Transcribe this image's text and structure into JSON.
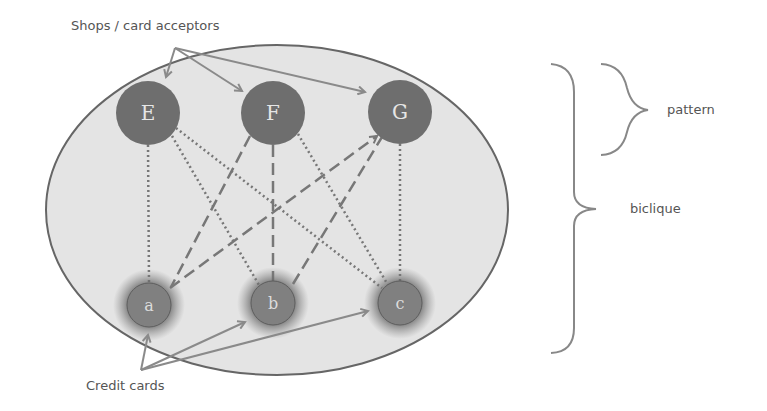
{
  "diagram": {
    "labels": {
      "shops": "Shops / card acceptors",
      "cards": "Credit cards",
      "pattern": "pattern",
      "biclique": "biclique"
    },
    "shop_nodes": [
      {
        "id": "E",
        "label": "E"
      },
      {
        "id": "F",
        "label": "F"
      },
      {
        "id": "G",
        "label": "G"
      }
    ],
    "card_nodes": [
      {
        "id": "a",
        "label": "a"
      },
      {
        "id": "b",
        "label": "b"
      },
      {
        "id": "c",
        "label": "c"
      }
    ],
    "edges": [
      {
        "from": "E",
        "to": "a",
        "style": "dotted"
      },
      {
        "from": "E",
        "to": "b",
        "style": "dotted"
      },
      {
        "from": "E",
        "to": "c",
        "style": "dotted"
      },
      {
        "from": "F",
        "to": "a",
        "style": "dashed"
      },
      {
        "from": "F",
        "to": "b",
        "style": "dashed"
      },
      {
        "from": "F",
        "to": "c",
        "style": "dotted"
      },
      {
        "from": "G",
        "to": "a",
        "style": "dashed"
      },
      {
        "from": "G",
        "to": "b",
        "style": "dashed"
      },
      {
        "from": "G",
        "to": "c",
        "style": "dotted"
      }
    ],
    "colors": {
      "ellipse_fill": "#e4e4e4",
      "ellipse_stroke": "#666666",
      "shop_node_fill": "#6e6e6e",
      "card_node_fill": "#808080",
      "edge": "#777777",
      "arrow": "#8a8a8a",
      "text": "#555555"
    }
  }
}
